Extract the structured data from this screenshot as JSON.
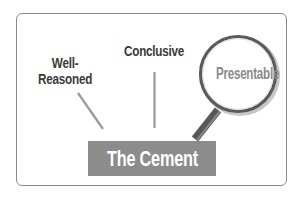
{
  "diagram": {
    "labels": {
      "conclusive": "Conclusive",
      "well_reasoned_line1": "Well-",
      "well_reasoned_line2": "Reasoned",
      "presentable": "Presentable"
    },
    "base": {
      "label": "The Cement"
    },
    "colors": {
      "frame_border": "#8a8a8a",
      "label_text": "#3a3a3a",
      "base_fill": "#8c8c8c",
      "base_text": "#ffffff",
      "lens_ring": "#555555",
      "lens_text": "#8a8a8a",
      "handle": "#555555",
      "connector": "#9a9a9a"
    },
    "icons": {
      "magnifier": "magnifying-glass-icon"
    }
  }
}
